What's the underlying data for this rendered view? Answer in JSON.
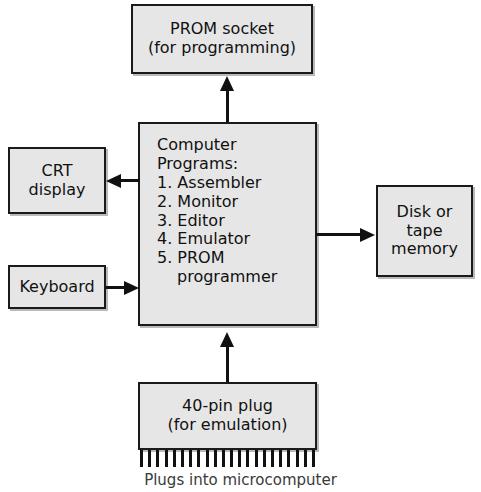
{
  "diagram": {
    "colors": {
      "box_fill": "#e6e6e6",
      "box_border": "#1a1a1a",
      "connector": "#111111",
      "page_background": "#ffffff",
      "caption_text": "#3a3a3a"
    },
    "boxes": {
      "prom_socket": {
        "line1": "PROM socket",
        "line2": "(for programming)"
      },
      "computer": {
        "line1": "Computer",
        "line2": "Programs:",
        "item1": "1. Assembler",
        "item2": "2. Monitor",
        "item3": "3. Editor",
        "item4": "4. Emulator",
        "item5": "5. PROM",
        "item5_cont": "programmer"
      },
      "crt": {
        "line1": "CRT",
        "line2": "display"
      },
      "keyboard": {
        "line1": "Keyboard"
      },
      "disk": {
        "line1": "Disk or",
        "line2": "tape",
        "line3": "memory"
      },
      "plug": {
        "line1": "40-pin plug",
        "line2": "(for emulation)"
      }
    },
    "caption": "Plugs into microcomputer",
    "pin_count": 22,
    "connectors": [
      {
        "name": "computer-to-prom-socket",
        "direction": "up"
      },
      {
        "name": "computer-to-crt-display",
        "direction": "left"
      },
      {
        "name": "keyboard-to-computer",
        "direction": "right"
      },
      {
        "name": "computer-to-disk-memory",
        "direction": "right"
      },
      {
        "name": "plug-to-computer",
        "direction": "up"
      }
    ]
  }
}
